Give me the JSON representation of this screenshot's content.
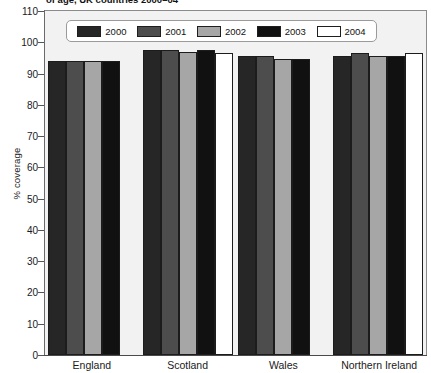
{
  "title": "of age, UK countries 2000–04",
  "axes": {
    "y_title": "% coverage",
    "y_ticks": [
      110,
      100,
      90,
      80,
      70,
      60,
      50,
      40,
      30,
      20,
      10,
      0
    ],
    "x_categories": [
      "England",
      "Scotland",
      "Wales",
      "Northern Ireland"
    ]
  },
  "legend": {
    "items": [
      {
        "label": "2000",
        "color": "#262626"
      },
      {
        "label": "2001",
        "color": "#4d4d4d"
      },
      {
        "label": "2002",
        "color": "#a6a6a6"
      },
      {
        "label": "2003",
        "color": "#111111"
      },
      {
        "label": "2004",
        "color": "#ffffff"
      }
    ]
  },
  "chart_data": {
    "type": "bar",
    "title": "of age, UK countries 2000–04",
    "xlabel": "",
    "ylabel": "% coverage",
    "ylim": [
      0,
      110
    ],
    "ytick_step": 10,
    "grid": false,
    "legend_position": "top-inside",
    "categories": [
      "England",
      "Scotland",
      "Wales",
      "Northern Ireland"
    ],
    "series": [
      {
        "name": "2000",
        "color": "#262626",
        "values": [
          94,
          97.5,
          95.5,
          95.5
        ]
      },
      {
        "name": "2001",
        "color": "#4d4d4d",
        "values": [
          94,
          97.5,
          95.5,
          96.5
        ]
      },
      {
        "name": "2002",
        "color": "#a6a6a6",
        "values": [
          94,
          97,
          94.5,
          95.5
        ]
      },
      {
        "name": "2003",
        "color": "#111111",
        "values": [
          94,
          97.5,
          94.5,
          95.5
        ]
      },
      {
        "name": "2004",
        "color": "#ffffff",
        "values": [
          null,
          96.5,
          null,
          96.5
        ]
      }
    ]
  }
}
